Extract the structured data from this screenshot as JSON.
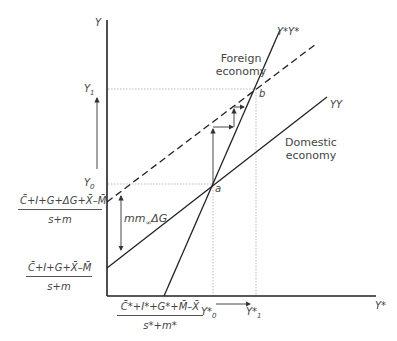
{
  "diagram": {
    "axes": {
      "y_label": "Y",
      "x_label": "Y*"
    },
    "curves": {
      "foreign": "Y*Y*",
      "domestic": "YY"
    },
    "regions": {
      "foreign_label_line1": "Foreign",
      "foreign_label_line2": "economy",
      "domestic_label_line1": "Domestic",
      "domestic_label_line2": "economy"
    },
    "points": {
      "a": "a",
      "b": "b"
    },
    "y_ticks": {
      "y1": "Y",
      "y1_sub": "1",
      "y0": "Y",
      "y0_sub": "0"
    },
    "x_ticks": {
      "y0star": "Y*",
      "y0star_sub": "0",
      "y1star": "Y*",
      "y1star_sub": "1"
    },
    "intercepts": {
      "shifted_num": "C̄+I+G+ΔG+X̄–M̄",
      "shifted_den": "s+m",
      "original_num": "C̄+I+G+X̄–M̄",
      "original_den": "s+m",
      "foreign_num": "C̄*+I*+G*+M̄–X̄",
      "foreign_den": "s*+m*"
    },
    "shift_label": "mm",
    "shift_label_sub": "∞",
    "shift_label_tail": "ΔG"
  }
}
